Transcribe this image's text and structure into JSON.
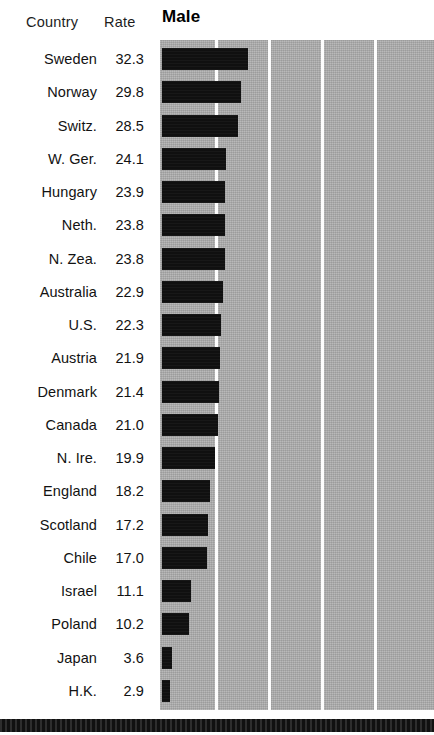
{
  "columns": {
    "country_header": "Country",
    "rate_header": "Rate"
  },
  "chart_title": "Male",
  "colors": {
    "plot_background": "#a9a9a9",
    "bar_fill": "#101010",
    "gridline": "#fdfdfd",
    "page_background": "#ffffff",
    "rule": "#111111",
    "text": "#121212"
  },
  "chart_data": {
    "type": "bar",
    "orientation": "horizontal",
    "title": "Male",
    "subtitle": "",
    "xlabel": "",
    "ylabel": "Country",
    "xlim": [
      0,
      103
    ],
    "grid": true,
    "gridlines_x": [
      20,
      40,
      60,
      80
    ],
    "tick_labels_x": [],
    "legend": [],
    "legend_position": "none",
    "value_column_header": "Rate",
    "category_column_header": "Country",
    "sorted": "descending",
    "categories": [
      "Sweden",
      "Norway",
      "Switz.",
      "W. Ger.",
      "Hungary",
      "Neth.",
      "N. Zea.",
      "Australia",
      "U.S.",
      "Austria",
      "Denmark",
      "Canada",
      "N. Ire.",
      "England",
      "Scotland",
      "Chile",
      "Israel",
      "Poland",
      "Japan",
      "H.K."
    ],
    "values": [
      32.3,
      29.8,
      28.5,
      24.1,
      23.9,
      23.8,
      23.8,
      22.9,
      22.3,
      21.9,
      21.4,
      21.0,
      19.9,
      18.2,
      17.2,
      17.0,
      11.1,
      10.2,
      3.6,
      2.9
    ],
    "value_labels": [
      "32.3",
      "29.8",
      "28.5",
      "24.1",
      "23.9",
      "23.8",
      "23.8",
      "22.9",
      "22.3",
      "21.9",
      "21.4",
      "21.0",
      "19.9",
      "18.2",
      "17.2",
      "17.0",
      "11.1",
      "10.2",
      "3.6",
      "2.9"
    ],
    "annotations": []
  }
}
